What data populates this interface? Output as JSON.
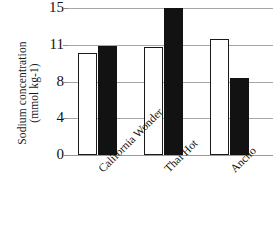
{
  "chart_data": {
    "type": "bar",
    "title": "",
    "subtitle": "",
    "xlabel": "",
    "ylabel_line1": "Sodium concentration",
    "ylabel_line2": "(mmol kg-1)",
    "categories": [
      "California Wonder",
      "Thai Hot",
      "Ancho"
    ],
    "series": [
      {
        "name": "open-bar-series",
        "fill": "white",
        "values": [
          10.3,
          10.85,
          11.6
        ]
      },
      {
        "name": "filled-bar-series",
        "fill": "black",
        "values": [
          10.9,
          15.0,
          8.3
        ]
      }
    ],
    "ytick_labels": [
      "0",
      "4",
      "8",
      "11",
      "15"
    ],
    "ytick_values": [
      0,
      4,
      8,
      11,
      15
    ],
    "ylim": [
      0,
      15
    ],
    "grid": true,
    "legend": "none",
    "axis_spacing": "categorical-even",
    "colors": {
      "open_bar_fill": "#ffffff",
      "open_bar_edge": "#1a1a1a",
      "filled_bar_fill": "#121212",
      "gridline": "#a6a6a6",
      "text": "#111111",
      "background": "#ffffff"
    }
  }
}
